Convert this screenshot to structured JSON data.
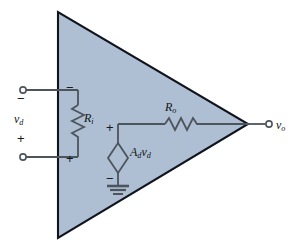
{
  "figure": {
    "kind": "circuit-diagram",
    "colors": {
      "triangle_fill": "#aebfd4",
      "triangle_stroke": "#11151b",
      "wire": "#4d545c",
      "label_text": "#111418",
      "background": "#ffffff"
    }
  },
  "labels": {
    "input_voltage": "v",
    "input_voltage_sub": "d",
    "input_resistance": "R",
    "input_resistance_sub": "i",
    "output_resistance": "R",
    "output_resistance_sub": "o",
    "dependent_source_gain": "A",
    "dependent_source_gain_sub": "d",
    "dependent_source_voltage": "v",
    "dependent_source_voltage_sub": "d",
    "output_voltage": "v",
    "output_voltage_sub": "o"
  },
  "polarity": {
    "input_terminal_minus": "−",
    "input_terminal_plus": "+",
    "ri_top_minus": "−",
    "ri_bottom_plus": "+",
    "source_top_plus": "+",
    "source_bottom_minus": "−"
  },
  "components": [
    {
      "name": "amplifier-triangle",
      "type": "triangle",
      "fill": "#aebfd4"
    },
    {
      "name": "input-resistor",
      "type": "resistor",
      "orientation": "vertical",
      "label": "Ri"
    },
    {
      "name": "output-resistor",
      "type": "resistor",
      "orientation": "horizontal",
      "label": "Ro"
    },
    {
      "name": "dependent-voltage-source",
      "type": "diamond",
      "label": "Advd"
    },
    {
      "name": "ground-symbol",
      "type": "ground",
      "bars": 3
    },
    {
      "name": "input-terminal-inverting",
      "type": "terminal-node"
    },
    {
      "name": "input-terminal-noninverting",
      "type": "terminal-node"
    },
    {
      "name": "output-terminal",
      "type": "terminal-node"
    }
  ]
}
